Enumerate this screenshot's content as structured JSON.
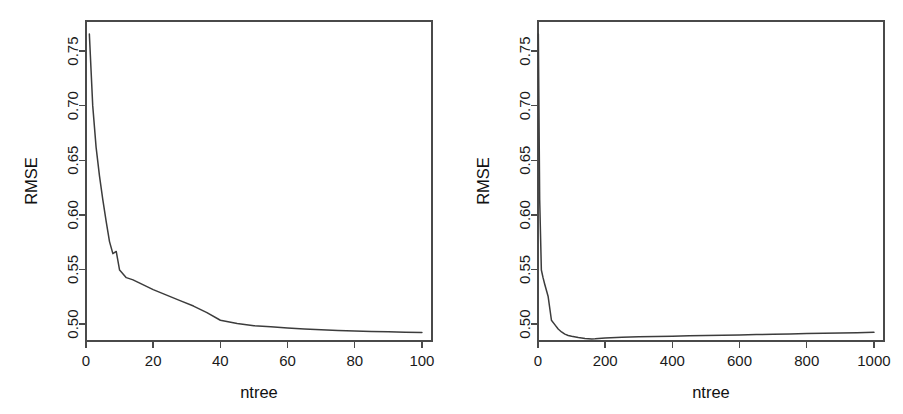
{
  "figure": {
    "background": "#ffffff",
    "line_color": "#3c3c3c",
    "axis_color": "#4a4a4a",
    "panel_count": 2
  },
  "chart_data": [
    {
      "type": "line",
      "panel": "left",
      "title": "",
      "xlabel": "ntree",
      "ylabel": "RMSE",
      "xlim": [
        0,
        103
      ],
      "ylim": [
        0.4845,
        0.7775
      ],
      "xticks": [
        0,
        20,
        40,
        60,
        80,
        100
      ],
      "xtick_labels": [
        "0",
        "20",
        "40",
        "60",
        "80",
        "100"
      ],
      "yticks": [
        0.5,
        0.55,
        0.6,
        0.65,
        0.7,
        0.75
      ],
      "ytick_labels": [
        "0.50",
        "0.55",
        "0.60",
        "0.65",
        "0.70",
        "0.75"
      ],
      "grid": false,
      "legend": false,
      "x": [
        1,
        2,
        3,
        4,
        5,
        6,
        7,
        8,
        9,
        10,
        12,
        14,
        16,
        18,
        20,
        24,
        28,
        32,
        36,
        40,
        45,
        50,
        55,
        60,
        65,
        70,
        75,
        80,
        85,
        90,
        95,
        100
      ],
      "y": [
        0.7655,
        0.7,
        0.662,
        0.636,
        0.614,
        0.594,
        0.5755,
        0.5645,
        0.5665,
        0.5495,
        0.5425,
        0.5405,
        0.5375,
        0.5345,
        0.5315,
        0.5265,
        0.5215,
        0.5165,
        0.5105,
        0.5035,
        0.5005,
        0.4985,
        0.4975,
        0.4965,
        0.4955,
        0.4948,
        0.4942,
        0.4937,
        0.4933,
        0.4929,
        0.4926,
        0.4922
      ]
    },
    {
      "type": "line",
      "panel": "right",
      "title": "",
      "xlabel": "ntree",
      "ylabel": "RMSE",
      "xlim": [
        0,
        1030
      ],
      "ylim": [
        0.4845,
        0.7775
      ],
      "xticks": [
        0,
        200,
        400,
        600,
        800,
        1000
      ],
      "xtick_labels": [
        "0",
        "200",
        "400",
        "600",
        "800",
        "1000"
      ],
      "yticks": [
        0.5,
        0.55,
        0.6,
        0.65,
        0.7,
        0.75
      ],
      "ytick_labels": [
        "0.50",
        "0.55",
        "0.60",
        "0.65",
        "0.70",
        "0.75"
      ],
      "grid": false,
      "legend": false,
      "x": [
        1,
        5,
        10,
        15,
        20,
        30,
        40,
        50,
        60,
        70,
        80,
        90,
        100,
        120,
        140,
        160,
        170,
        200,
        250,
        300,
        350,
        400,
        450,
        500,
        550,
        600,
        650,
        700,
        750,
        800,
        850,
        900,
        950,
        1000
      ],
      "y": [
        0.7655,
        0.614,
        0.5495,
        0.5425,
        0.5365,
        0.5255,
        0.5035,
        0.4995,
        0.4955,
        0.4928,
        0.4908,
        0.4896,
        0.4888,
        0.4876,
        0.4868,
        0.4864,
        0.4865,
        0.4872,
        0.4879,
        0.4883,
        0.4886,
        0.4889,
        0.4892,
        0.4895,
        0.4898,
        0.4901,
        0.4904,
        0.4907,
        0.491,
        0.4913,
        0.4916,
        0.4919,
        0.4921,
        0.4924
      ]
    }
  ],
  "panels": {
    "left": {
      "name": "left-panel",
      "ylabel": "RMSE",
      "xlabel": "ntree"
    },
    "right": {
      "name": "right-panel",
      "ylabel": "RMSE",
      "xlabel": "ntree"
    }
  }
}
